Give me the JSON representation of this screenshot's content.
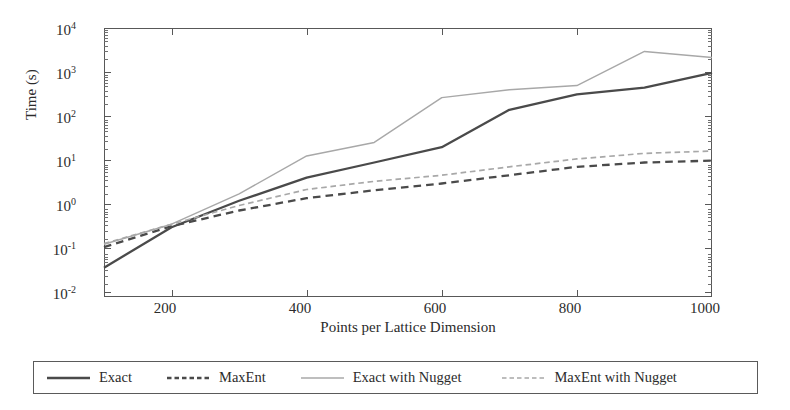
{
  "chart_data": {
    "type": "line",
    "title": "",
    "xlabel": "Points per Lattice Dimension",
    "ylabel": "Time (s)",
    "yscale": "log",
    "xlim": [
      100,
      1000
    ],
    "ylim": [
      0.01,
      10000
    ],
    "grid": false,
    "x_ticks": [
      "200",
      "400",
      "600",
      "800",
      "1000"
    ],
    "x_tick_values": [
      200,
      400,
      600,
      800,
      1000
    ],
    "y_ticks": [
      "10−2",
      "10−1",
      "10⁰",
      "10¹",
      "10²",
      "10³",
      "10⁴"
    ],
    "y_tick_values": [
      0.01,
      0.1,
      1,
      10,
      100,
      1000,
      10000
    ],
    "y_tick_mantissas": [
      "-2",
      "-1",
      "0",
      "1",
      "2",
      "3",
      "4"
    ],
    "legend_position": "below-figure-boxed",
    "x": [
      100,
      200,
      300,
      400,
      500,
      600,
      700,
      800,
      900,
      1000
    ],
    "series": [
      {
        "name": "Exact",
        "style": "solid",
        "color": "#4a4a4a",
        "width": 2.3,
        "values": [
          0.045,
          0.36,
          1.4,
          4.6,
          10,
          22,
          150,
          330,
          470,
          1000
        ]
      },
      {
        "name": "MaxEnt",
        "style": "dashed",
        "color": "#4a4a4a",
        "width": 2.3,
        "values": [
          0.13,
          0.38,
          0.85,
          1.6,
          2.4,
          3.4,
          5.2,
          8.0,
          10.0,
          11.0
        ]
      },
      {
        "name": "Exact with Nugget",
        "style": "solid",
        "color": "#a8a8a8",
        "width": 1.4,
        "values": [
          0.15,
          0.42,
          2.0,
          14,
          28,
          280,
          420,
          520,
          3000,
          2200
        ]
      },
      {
        "name": "MaxEnt with Nugget",
        "style": "dashed",
        "color": "#a8a8a8",
        "width": 1.7,
        "values": [
          0.155,
          0.42,
          1.1,
          2.5,
          3.8,
          5.2,
          8.0,
          12.0,
          16.0,
          18.0
        ]
      }
    ]
  },
  "legend": {
    "entries": [
      {
        "label": "Exact"
      },
      {
        "label": "MaxEnt"
      },
      {
        "label": "Exact with Nugget"
      },
      {
        "label": "MaxEnt with Nugget"
      }
    ]
  },
  "colors": {
    "dark_series": "#4a4a4a",
    "light_series": "#a8a8a8",
    "axis": "#585858",
    "background": "#ffffff"
  }
}
